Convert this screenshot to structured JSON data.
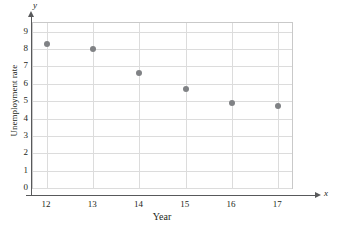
{
  "chart_data": {
    "type": "scatter",
    "title": "",
    "xlabel": "Year",
    "ylabel": "Unemployment rate",
    "x_axis_symbol": "x",
    "y_axis_symbol": "y",
    "xlim": [
      11.7,
      17.3
    ],
    "ylim": [
      0,
      9.5
    ],
    "grid": true,
    "legend": "none",
    "x_ticks": [
      12,
      13,
      14,
      15,
      16,
      17
    ],
    "x_tick_labels": [
      "12",
      "13",
      "14",
      "15",
      "16",
      "17"
    ],
    "y_ticks": [
      0,
      1,
      2,
      3,
      4,
      5,
      6,
      7,
      8,
      9
    ],
    "y_tick_labels": [
      "0",
      "1",
      "2",
      "3",
      "4",
      "5",
      "6",
      "7",
      "8",
      "9"
    ],
    "marker_color": "#808285",
    "grid_color": "#dcdcdc",
    "axis_color": "#58595b",
    "x": [
      12,
      13,
      14,
      15,
      16,
      17
    ],
    "values": [
      8.3,
      8.0,
      6.6,
      5.7,
      4.9,
      4.75
    ],
    "points": [
      {
        "x": 12,
        "y": 8.3
      },
      {
        "x": 13,
        "y": 8.0
      },
      {
        "x": 14,
        "y": 6.6
      },
      {
        "x": 15,
        "y": 5.7
      },
      {
        "x": 16,
        "y": 4.9
      },
      {
        "x": 17,
        "y": 4.75
      }
    ]
  }
}
